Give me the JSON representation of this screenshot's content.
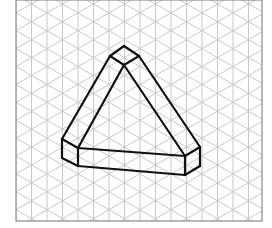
{
  "diagram": {
    "type": "isometric-drawing",
    "grid": {
      "frame": {
        "x": 16,
        "y": 0,
        "width": 246,
        "height": 221
      },
      "spacing_x": 15.5,
      "line_color": "#c8c8c8",
      "frame_color": "#8a8a8a"
    },
    "shape": {
      "stroke_color": "#111111",
      "stroke_width": 2.2,
      "edges": [
        [
          [
            124,
            46
          ],
          [
            110,
            56
          ]
        ],
        [
          [
            124,
            46
          ],
          [
            139,
            56
          ]
        ],
        [
          [
            110,
            56
          ],
          [
            124,
            65
          ]
        ],
        [
          [
            139,
            56
          ],
          [
            124,
            65
          ]
        ],
        [
          [
            110,
            56
          ],
          [
            62,
            139
          ]
        ],
        [
          [
            124,
            65
          ],
          [
            78,
            148
          ]
        ],
        [
          [
            139,
            56
          ],
          [
            200,
            147
          ]
        ],
        [
          [
            124,
            65
          ],
          [
            185,
            156
          ]
        ],
        [
          [
            62,
            139
          ],
          [
            78,
            148
          ]
        ],
        [
          [
            62,
            139
          ],
          [
            62,
            158
          ]
        ],
        [
          [
            78,
            148
          ],
          [
            78,
            166
          ]
        ],
        [
          [
            62,
            158
          ],
          [
            78,
            166
          ]
        ],
        [
          [
            78,
            148
          ],
          [
            185,
            156
          ]
        ],
        [
          [
            78,
            166
          ],
          [
            185,
            175
          ]
        ],
        [
          [
            185,
            156
          ],
          [
            200,
            147
          ]
        ],
        [
          [
            185,
            156
          ],
          [
            185,
            175
          ]
        ],
        [
          [
            200,
            147
          ],
          [
            200,
            166
          ]
        ],
        [
          [
            185,
            175
          ],
          [
            200,
            166
          ]
        ]
      ]
    }
  }
}
